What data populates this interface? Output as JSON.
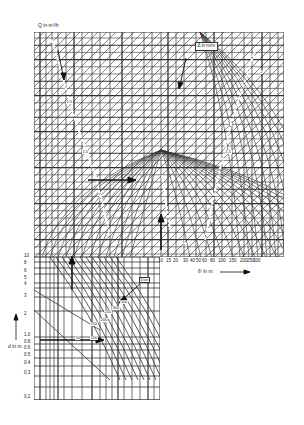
{
  "chart_data": {
    "type": "line",
    "title": "",
    "top_label": "Q in m³/h",
    "box_label": "Δ in m/m",
    "x_axis_right": {
      "label": "δ' in m",
      "ticks": [
        "10",
        "15",
        "20",
        "30",
        "40",
        "50",
        "60",
        "80",
        "100",
        "150",
        "200",
        "250",
        "300"
      ]
    },
    "y_axis_lower": {
      "label": "d in m",
      "ticks": [
        "10",
        "8",
        "6",
        "5",
        "4",
        "3",
        "2",
        "1.0",
        "0.8",
        "0.6",
        "0.5",
        "0.4",
        "0.3",
        "0.2"
      ]
    },
    "lower_curve_labels": [
      "50",
      "100",
      "150",
      "200",
      "250",
      "300",
      "500"
    ],
    "lower_annotation": "Durc",
    "upper_curve_labels": [
      "1.5",
      "1.5",
      "1.5",
      "2",
      "1"
    ],
    "grid": true
  },
  "labels": {
    "q_label": "Q in m³/h",
    "box_num": "Δ",
    "box_mid": "in",
    "box_frac": "m/m",
    "x_label": "δ' in m",
    "y_label": "d in m",
    "durc": "Durc"
  },
  "x_ticks": [
    "10",
    "15",
    "20",
    "30",
    "40",
    "50",
    "60",
    "80",
    "100",
    "150",
    "200",
    "250",
    "300"
  ],
  "y_ticks": [
    "10",
    "8",
    "6",
    "5",
    "4",
    "3",
    "2",
    "1.0",
    "0.8",
    "0.6",
    "0.5",
    "0.4",
    "0.3",
    "0.2"
  ],
  "lower_curves": [
    "50",
    "100",
    "150",
    "200",
    "250",
    "300",
    "500"
  ],
  "upper_curves": [
    "1.5",
    "1.5",
    "2",
    "1.5",
    "1"
  ]
}
